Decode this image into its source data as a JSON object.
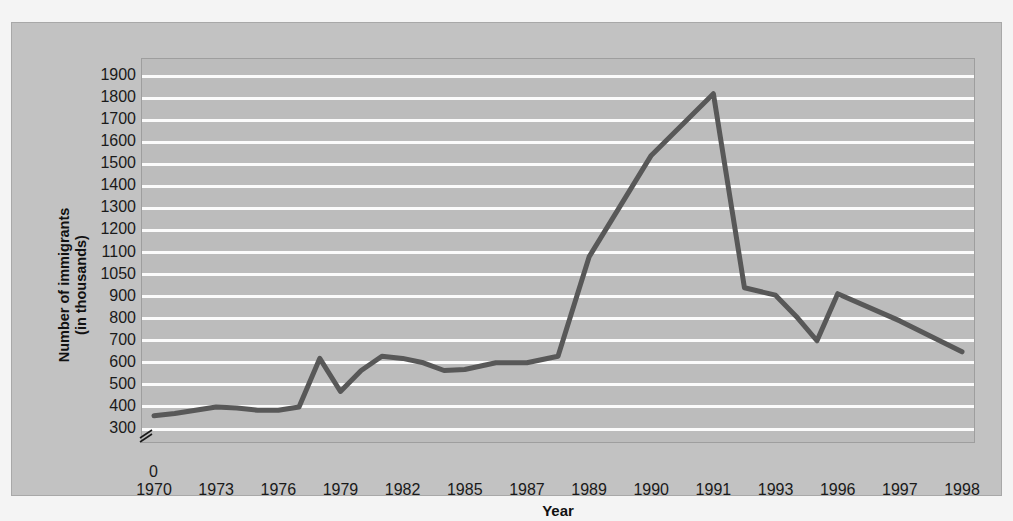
{
  "chart_data": {
    "type": "line",
    "title": "",
    "xlabel": "Year",
    "ylabel": "Number of immigrants\n(in thousands)",
    "ylabel_line1": "Number of immigrants",
    "ylabel_line2": "(in thousands)",
    "grid": true,
    "legend": "none",
    "axis_break": true,
    "axis_break_note": "broken y-axis between 0 and 300",
    "y_tick_labels": [
      "1900",
      "1800",
      "1700",
      "1600",
      "1500",
      "1400",
      "1300",
      "1200",
      "1100",
      "1050",
      "900",
      "800",
      "700",
      "600",
      "500",
      "400",
      "300"
    ],
    "y_origin_label": "0",
    "ylim": [
      300,
      1900
    ],
    "x_tick_labels": [
      "1970",
      "1973",
      "1976",
      "1979",
      "1982",
      "1985",
      "1987",
      "1989",
      "1990",
      "1991",
      "1993",
      "1996",
      "1997",
      "1998"
    ],
    "xlim": [
      1970,
      1998
    ],
    "series": [
      {
        "name": "Number of immigrants (in thousands)",
        "color": "#585858",
        "x": [
          1970,
          1971,
          1972,
          1973,
          1974,
          1975,
          1976,
          1977,
          1978,
          1979,
          1980,
          1981,
          1982,
          1983,
          1984,
          1985,
          1986,
          1987,
          1988,
          1989,
          1990,
          1991,
          1992,
          1993,
          1994,
          1995,
          1996,
          1997,
          1998
        ],
        "values": [
          360,
          370,
          385,
          400,
          395,
          385,
          385,
          400,
          620,
          470,
          565,
          630,
          620,
          600,
          565,
          570,
          600,
          600,
          630,
          1090,
          1540,
          1820,
          960,
          910,
          810,
          700,
          920,
          790,
          650
        ]
      }
    ],
    "annotations": []
  },
  "colors": {
    "figure_background": "#f4f4f4",
    "panel_background": "#c2c2c2",
    "plot_background": "#bcbcbc",
    "gridline": "#fbfbfb",
    "line": "#585858",
    "text": "#1a1a1a"
  }
}
